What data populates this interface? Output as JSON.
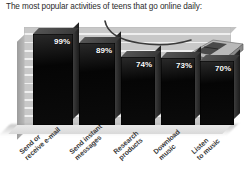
{
  "chart_data": {
    "type": "bar",
    "title": "The most popular activities of teens that go online daily:",
    "xlabel": "",
    "ylabel": "",
    "ylim": [
      0,
      100
    ],
    "grid": true,
    "legend": "none",
    "categories": [
      "Send or\nreceive e-mail",
      "Send instant\nmessages",
      "Research\nproducts",
      "Download\nmusic",
      "Listen\nto music"
    ],
    "values": [
      99,
      89,
      74,
      73,
      70
    ],
    "value_labels": [
      "99%",
      "89%",
      "74%",
      "73%",
      "70%"
    ],
    "bar_color": "#0a0a0a",
    "panel_color": "#c8c8c8",
    "gridline_color": "#efefef"
  },
  "decor": {
    "mouse_icon": "computer-mouse-icon",
    "cable_icon": "mouse-cable-icon"
  }
}
